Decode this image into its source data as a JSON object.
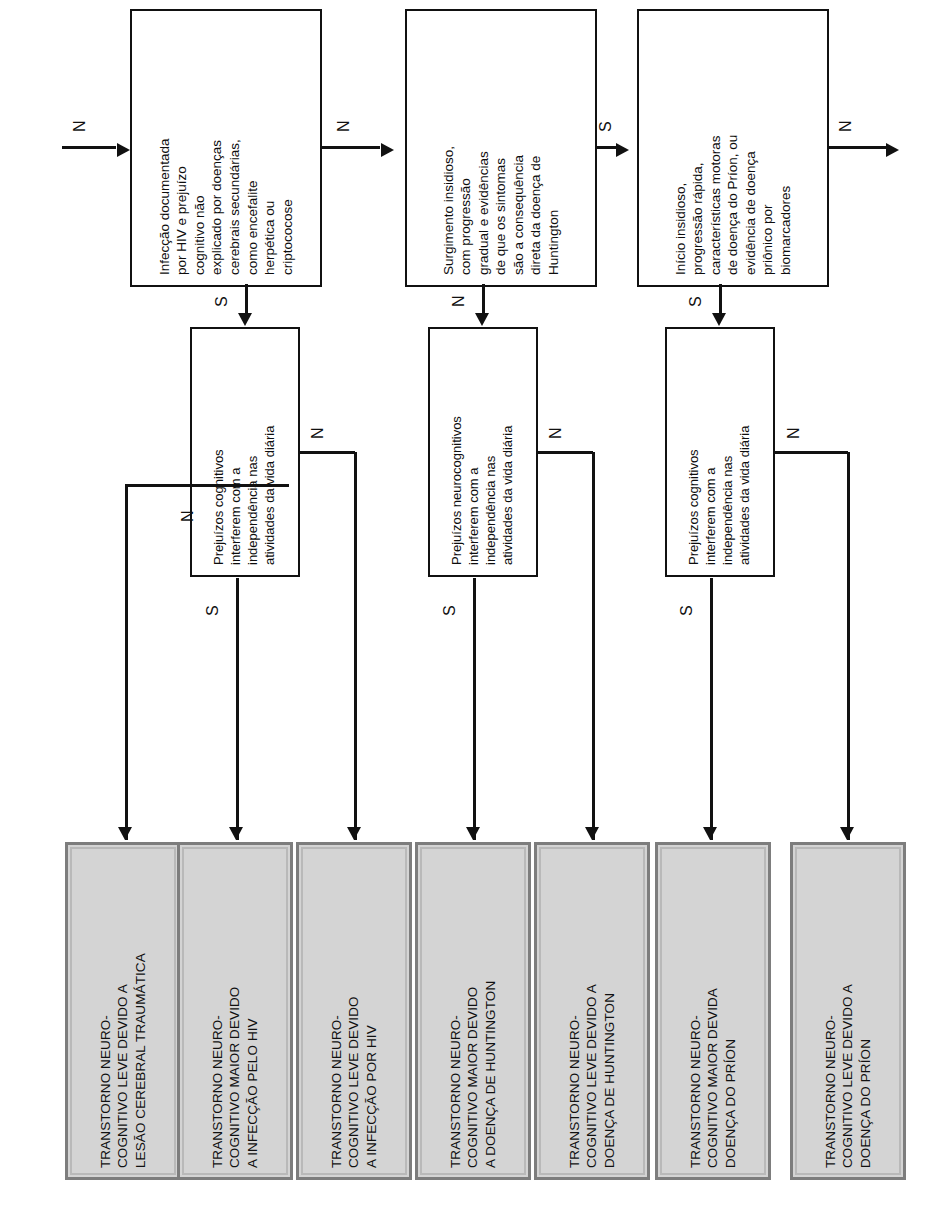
{
  "diagram": {
    "orientation": "rotated-90-ccw",
    "colors": {
      "outcome_fill": "#d4d4d4",
      "outcome_border": "#7d7d7d",
      "line": "#111111",
      "background": "#ffffff"
    },
    "outcomes": [
      {
        "id": "tnc-leve-tce",
        "label": "TRANSTORNO NEURO-\nCOGNITIVO LEVE DEVIDO A\nLESÃO CEREBRAL TRAUMÁTICA"
      },
      {
        "id": "tnc-maior-hiv",
        "label": "TRANSTORNO NEURO-\nCOGNITIVO MAIOR DEVIDO\nA INFECÇÃO PELO HIV"
      },
      {
        "id": "tnc-leve-hiv",
        "label": "TRANSTORNO NEURO-\nCOGNITIVO LEVE DEVIDO\nA INFECÇÃO POR HIV"
      },
      {
        "id": "tnc-maior-huntington",
        "label": "TRANSTORNO NEURO-\nCOGNITIVO MAIOR DEVIDO\nA DOENÇA DE HUNTINGTON"
      },
      {
        "id": "tnc-leve-huntington",
        "label": "TRANSTORNO NEURO-\nCOGNITIVO LEVE DEVIDO A\nDOENÇA DE HUNTINGTON"
      },
      {
        "id": "tnc-maior-prion",
        "label": "TRANSTORNO NEURO-\nCOGNITIVO MAIOR DEVIDA\nDOENÇA DO PRÍON"
      },
      {
        "id": "tnc-leve-prion",
        "label": "TRANSTORNO NEURO-\nCOGNITIVO LEVE DEVIDO A\nDOENÇA DO PRÍON"
      }
    ],
    "decisions": [
      {
        "id": "dec-hiv",
        "label": "Prejuízos cognitivos\ninterferem com a\nindependência nas\natividades da vida diária"
      },
      {
        "id": "dec-huntington",
        "label": "Prejuízos neurocognitivos\ninterferem com a\nindependência nas\natividades da vida diária"
      },
      {
        "id": "dec-prion",
        "label": "Prejuízos cognitivos\ninterferem com a\nindependência nas\natividades da vida diária"
      }
    ],
    "criteria": [
      {
        "id": "crit-hiv",
        "label": "Infecção documentada\npor HIV e prejuízo\ncognitivo não\nexplicado por doenças\ncerebrais secundárias,\ncomo encefalite\nherpética ou\ncriptococose"
      },
      {
        "id": "crit-huntington",
        "label": "Surgimento insidioso,\ncom progressão\ngradual e evidências\nde que os sintomas\nsão a consequência\ndireta da doença de\nHuntington"
      },
      {
        "id": "crit-prion",
        "label": "Início insidioso,\nprogressão rápida,\ncaracterísticas motoras\nde doença do Príon, ou\nevidência de doença\npriônico por\nbiomarcadores"
      }
    ],
    "edge_labels": {
      "yes": "S",
      "no": "N"
    },
    "edges": [
      {
        "id": "e-in-hiv",
        "label": "N"
      },
      {
        "id": "e-crit-hiv-yes",
        "label": "S"
      },
      {
        "id": "e-crit-hiv-no",
        "label": "N"
      },
      {
        "id": "e-dec-hiv-yes",
        "label": "S"
      },
      {
        "id": "e-dec-hiv-no",
        "label": "N"
      },
      {
        "id": "e-tce-no",
        "label": "N"
      },
      {
        "id": "e-crit-hunt-yes",
        "label": "S"
      },
      {
        "id": "e-crit-hunt-no",
        "label": "N"
      },
      {
        "id": "e-dec-hunt-yes",
        "label": "S"
      },
      {
        "id": "e-dec-hunt-no",
        "label": "N"
      },
      {
        "id": "e-crit-prion-yes",
        "label": "S"
      },
      {
        "id": "e-crit-prion-no",
        "label": "N"
      },
      {
        "id": "e-dec-prion-yes",
        "label": "S"
      },
      {
        "id": "e-dec-prion-no",
        "label": "N"
      }
    ]
  }
}
